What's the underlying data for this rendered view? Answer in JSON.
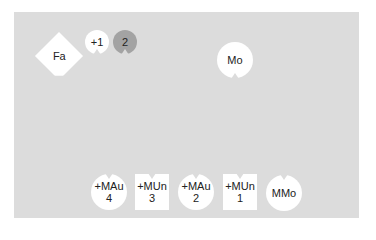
{
  "board": {
    "background": "#dcdcdc"
  },
  "tokens": {
    "fa": {
      "label": "Fa",
      "shape": "diamond"
    },
    "plus1": {
      "label": "+1",
      "shape": "circle"
    },
    "two": {
      "label": "2",
      "shape": "circle",
      "color": "#a3a3a3"
    },
    "mo": {
      "label": "Mo",
      "shape": "circle"
    },
    "bottom": [
      {
        "line1": "+MAu",
        "line2": "4",
        "shape": "circle"
      },
      {
        "line1": "+MUn",
        "line2": "3",
        "shape": "square"
      },
      {
        "line1": "+MAu",
        "line2": "2",
        "shape": "circle"
      },
      {
        "line1": "+MUn",
        "line2": "1",
        "shape": "square"
      },
      {
        "line1": "MMo",
        "line2": "",
        "shape": "circle"
      }
    ]
  }
}
